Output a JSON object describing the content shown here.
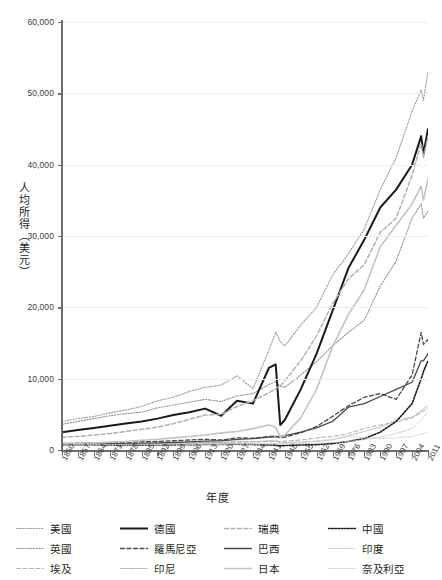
{
  "chart_data": {
    "type": "line",
    "title": "",
    "xlabel": "年度",
    "ylabel": "人均所得（美元）",
    "grid": true,
    "legend_position": "bottom",
    "xlim": [
      1850,
      2011
    ],
    "ylim": [
      0,
      60000
    ],
    "y_ticks": [
      "0",
      "10,000",
      "20,000",
      "30,000",
      "40,000",
      "50,000",
      "60,000"
    ],
    "y_tick_values": [
      0,
      10000,
      20000,
      30000,
      40000,
      50000,
      60000
    ],
    "x_ticks": [
      "1850",
      "1857",
      "1864",
      "1871",
      "1878",
      "1885",
      "1892",
      "1899",
      "1906",
      "1913",
      "1920",
      "1927",
      "1934",
      "1941",
      "1948",
      "1955",
      "1962",
      "1969",
      "1976",
      "1983",
      "1990",
      "1997",
      "2004",
      "2011"
    ],
    "x_tick_values": [
      1850,
      1857,
      1864,
      1871,
      1878,
      1885,
      1892,
      1899,
      1906,
      1913,
      1920,
      1927,
      1934,
      1941,
      1948,
      1955,
      1962,
      1969,
      1976,
      1983,
      1990,
      1997,
      2004,
      2011
    ],
    "x": [
      1850,
      1857,
      1864,
      1871,
      1878,
      1885,
      1892,
      1899,
      1906,
      1913,
      1920,
      1927,
      1934,
      1941,
      1944,
      1946,
      1948,
      1955,
      1962,
      1969,
      1976,
      1983,
      1990,
      1997,
      2004,
      2008,
      2009,
      2011
    ],
    "series": [
      {
        "name": "美國",
        "style": "dotted",
        "color": "#9a9a9a",
        "width": 1.1,
        "values": [
          4000,
          4400,
          4700,
          5200,
          5600,
          6100,
          6900,
          7400,
          8200,
          8800,
          9100,
          10400,
          8600,
          14000,
          16500,
          15200,
          14600,
          17500,
          20000,
          24500,
          27500,
          31000,
          36500,
          41000,
          47500,
          50500,
          49000,
          53000
        ]
      },
      {
        "name": "英國",
        "style": "dotted",
        "color": "#8f8f8f",
        "width": 1.1,
        "values": [
          3600,
          4000,
          4400,
          4800,
          5100,
          5300,
          5900,
          6300,
          6700,
          7100,
          6800,
          7600,
          7900,
          9200,
          9600,
          8900,
          8800,
          10500,
          12400,
          14600,
          16500,
          18200,
          23000,
          26500,
          32500,
          34500,
          32500,
          33500
        ]
      },
      {
        "name": "埃及",
        "style": "dashed",
        "color": "#b5b5b5",
        "width": 1.1,
        "values": [
          800,
          820,
          850,
          880,
          900,
          920,
          950,
          980,
          1020,
          1050,
          1050,
          1100,
          1120,
          1200,
          1250,
          1200,
          1250,
          1400,
          1700,
          1900,
          2300,
          3000,
          3500,
          3900,
          4500,
          5300,
          5500,
          5800
        ]
      },
      {
        "name": "德國",
        "style": "solid",
        "color": "#1a1a1a",
        "width": 2.0,
        "values": [
          2500,
          2800,
          3100,
          3400,
          3700,
          4000,
          4400,
          4900,
          5300,
          5800,
          4800,
          6900,
          6500,
          11500,
          12000,
          3500,
          4200,
          8500,
          13500,
          19500,
          25500,
          29500,
          34000,
          36500,
          40000,
          44000,
          41500,
          45000
        ]
      },
      {
        "name": "羅馬尼亞",
        "style": "dashed",
        "color": "#4a4a4a",
        "width": 1.3,
        "values": [
          900,
          950,
          1000,
          1050,
          1100,
          1150,
          1200,
          1300,
          1400,
          1500,
          1400,
          1700,
          1650,
          1900,
          1950,
          1700,
          1800,
          2400,
          3300,
          4700,
          6200,
          7400,
          7900,
          7100,
          10500,
          16500,
          14800,
          15500
        ]
      },
      {
        "name": "印尼",
        "style": "fine-dotted",
        "color": "#a9a9a9",
        "width": 1.0,
        "values": [
          700,
          720,
          740,
          780,
          820,
          850,
          900,
          950,
          1000,
          1080,
          1000,
          1250,
          1150,
          1300,
          1250,
          1000,
          1050,
          1150,
          1200,
          1450,
          2000,
          2600,
          3200,
          4200,
          4600,
          5500,
          5800,
          6200
        ]
      },
      {
        "name": "瑞典",
        "style": "dashed",
        "color": "#b0b0b0",
        "width": 1.5,
        "values": [
          1800,
          1900,
          2100,
          2300,
          2600,
          2900,
          3200,
          3700,
          4300,
          4900,
          5000,
          6100,
          6900,
          8000,
          8600,
          9000,
          9700,
          12500,
          16000,
          20500,
          24000,
          26000,
          30500,
          32500,
          38500,
          43000,
          41000,
          44000
        ]
      },
      {
        "name": "巴西",
        "style": "solid",
        "color": "#4a4a4a",
        "width": 1.3,
        "values": [
          800,
          820,
          850,
          880,
          900,
          950,
          1000,
          1050,
          1150,
          1250,
          1300,
          1500,
          1600,
          1800,
          1850,
          1900,
          2000,
          2500,
          3100,
          4000,
          6000,
          6500,
          7500,
          8500,
          9500,
          12500,
          12500,
          13500
        ]
      },
      {
        "name": "日本",
        "style": "solid",
        "color": "#c3c3c3",
        "width": 1.6,
        "values": [
          900,
          950,
          1000,
          1100,
          1200,
          1350,
          1500,
          1700,
          1900,
          2100,
          2400,
          2600,
          3000,
          3500,
          3200,
          1800,
          2100,
          4500,
          8500,
          14500,
          19000,
          22500,
          28500,
          31500,
          34500,
          37000,
          35000,
          38000
        ]
      },
      {
        "name": "中國",
        "style": "dotted-bold",
        "color": "#1a1a1a",
        "width": 1.6,
        "values": [
          700,
          700,
          690,
          680,
          680,
          680,
          700,
          720,
          750,
          780,
          760,
          800,
          760,
          700,
          680,
          600,
          620,
          700,
          750,
          900,
          1200,
          1600,
          2500,
          4000,
          6500,
          10000,
          11000,
          12500
        ]
      },
      {
        "name": "印度",
        "style": "dotted",
        "color": "#c8c8c8",
        "width": 1.0,
        "values": [
          750,
          760,
          770,
          780,
          790,
          800,
          820,
          840,
          860,
          880,
          850,
          900,
          880,
          900,
          880,
          800,
          820,
          900,
          950,
          1050,
          1200,
          1450,
          1800,
          2300,
          3000,
          4200,
          4600,
          5400
        ]
      },
      {
        "name": "奈及利亞",
        "style": "fine-dotted",
        "color": "#cfcfcf",
        "width": 1.0,
        "values": [
          650,
          660,
          670,
          680,
          690,
          700,
          720,
          740,
          760,
          780,
          780,
          820,
          800,
          850,
          860,
          820,
          850,
          950,
          1300,
          1500,
          1900,
          1700,
          1600,
          1700,
          1900,
          2200,
          2300,
          2500
        ]
      }
    ]
  }
}
